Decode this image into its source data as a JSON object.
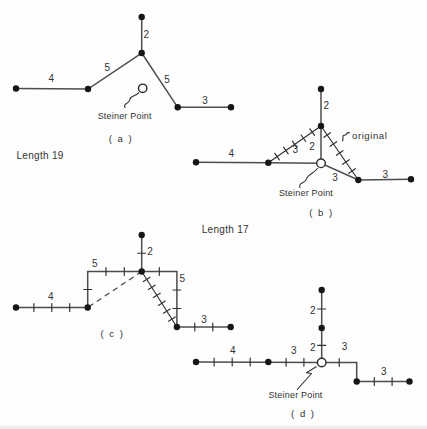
{
  "figure": {
    "background": "#fdfdfd",
    "ink": "#3c3c3c",
    "diagram_a": {
      "caption": "( a )",
      "length_label": "Length 19",
      "steiner_label": "Steiner Point",
      "edges": {
        "top": "2",
        "left_diagonal": "5",
        "right_diagonal": "5",
        "left_terminal": "4",
        "right_terminal": "3"
      }
    },
    "diagram_b": {
      "caption": "( b )",
      "length_label": "Length 17",
      "steiner_label": "Steiner Point",
      "original_label": "original",
      "edges": {
        "top": "2",
        "junction_to_steiner": "2",
        "steiner_to_left": "3",
        "left_terminal": "4",
        "steiner_to_right": "3",
        "right_terminal": "3"
      }
    },
    "diagram_c": {
      "caption": "( c )",
      "edges": {
        "top": "2",
        "upper_left_path": "5",
        "upper_right_path": "5",
        "left_terminal": "4",
        "right_terminal": "3"
      }
    },
    "diagram_d": {
      "caption": "( d )",
      "steiner_label": "Steiner Point",
      "edges": {
        "upper_vertical": "2",
        "lower_vertical": "2",
        "left_terminal": "4",
        "steiner_left": "3",
        "steiner_right": "3",
        "right_terminal": "3"
      }
    }
  }
}
